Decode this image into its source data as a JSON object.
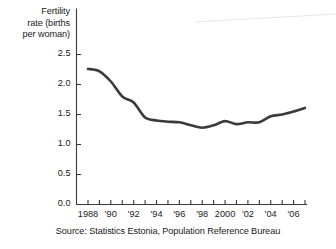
{
  "chart_data": {
    "type": "line",
    "title": "",
    "subtitle": "",
    "xlabel": "",
    "ylabel": "Fertility rate (births per woman)",
    "ylabel_lines": [
      "Fertility",
      "rate (births",
      "per woman)"
    ],
    "source": "Source:  Statistics Estonia, Population Reference Bureau",
    "grid": false,
    "legend": "none",
    "line_color": "#3a3a3a",
    "axis_color": "#3a3a3a",
    "background_color": "#ffffff",
    "xlim": [
      1988,
      2007
    ],
    "ylim": [
      0.0,
      2.5
    ],
    "ytick_values": [
      0.0,
      0.5,
      1.0,
      1.5,
      2.0,
      2.5
    ],
    "ytick_labels": [
      "0.0",
      "0.5",
      "1.0",
      "1.5",
      "2.0",
      "2.5"
    ],
    "xtick_values": [
      1988,
      1989,
      1990,
      1991,
      1992,
      1993,
      1994,
      1995,
      1996,
      1997,
      1998,
      1999,
      2000,
      2001,
      2002,
      2003,
      2004,
      2005,
      2006,
      2007
    ],
    "xtick_labels_shown": [
      {
        "year": 1988,
        "label": "1988"
      },
      {
        "year": 1990,
        "label": "'90"
      },
      {
        "year": 1992,
        "label": "'92"
      },
      {
        "year": 1994,
        "label": "'94"
      },
      {
        "year": 1996,
        "label": "'96"
      },
      {
        "year": 1998,
        "label": "'98"
      },
      {
        "year": 2000,
        "label": "2000"
      },
      {
        "year": 2002,
        "label": "'02"
      },
      {
        "year": 2004,
        "label": "'04"
      },
      {
        "year": 2006,
        "label": "'06"
      }
    ],
    "x": [
      1988,
      1989,
      1990,
      1991,
      1992,
      1993,
      1994,
      1995,
      1996,
      1997,
      1998,
      1999,
      2000,
      2001,
      2002,
      2003,
      2004,
      2005,
      2006,
      2007
    ],
    "values": [
      2.26,
      2.22,
      2.05,
      1.8,
      1.7,
      1.45,
      1.4,
      1.38,
      1.37,
      1.32,
      1.28,
      1.32,
      1.39,
      1.34,
      1.37,
      1.37,
      1.47,
      1.5,
      1.55,
      1.61
    ],
    "series": [
      {
        "name": "Fertility rate",
        "values": [
          2.26,
          2.22,
          2.05,
          1.8,
          1.7,
          1.45,
          1.4,
          1.38,
          1.37,
          1.32,
          1.28,
          1.32,
          1.39,
          1.34,
          1.37,
          1.37,
          1.47,
          1.5,
          1.55,
          1.61
        ]
      }
    ]
  }
}
